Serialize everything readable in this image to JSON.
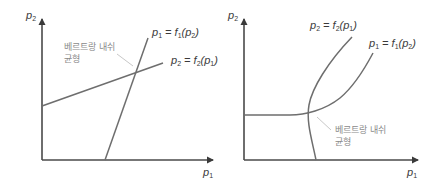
{
  "panels": [
    {
      "id": "left",
      "axes": {
        "y_label": "p",
        "y_sub": "2",
        "x_label": "p",
        "x_sub": "1"
      },
      "curves": [
        {
          "name": "reaction-p1",
          "label_lhs": "p",
          "label_lhs_sub": "1",
          "label_rhs_fn": "f",
          "label_rhs_fn_sub": "1",
          "label_rhs_arg": "p",
          "label_rhs_arg_sub": "2",
          "shape": "line"
        },
        {
          "name": "reaction-p2",
          "label_lhs": "p",
          "label_lhs_sub": "2",
          "label_rhs_fn": "f",
          "label_rhs_fn_sub": "2",
          "label_rhs_arg": "p",
          "label_rhs_arg_sub": "1",
          "shape": "line"
        }
      ],
      "annotation": {
        "text": "베르트랑 내쉬\n균형"
      }
    },
    {
      "id": "right",
      "axes": {
        "y_label": "p",
        "y_sub": "2",
        "x_label": "p",
        "x_sub": "1"
      },
      "curves": [
        {
          "name": "reaction-p2",
          "label_lhs": "p",
          "label_lhs_sub": "2",
          "label_rhs_fn": "f",
          "label_rhs_fn_sub": "2",
          "label_rhs_arg": "p",
          "label_rhs_arg_sub": "1",
          "shape": "curve"
        },
        {
          "name": "reaction-p1",
          "label_lhs": "p",
          "label_lhs_sub": "1",
          "label_rhs_fn": "f",
          "label_rhs_fn_sub": "1",
          "label_rhs_arg": "p",
          "label_rhs_arg_sub": "2",
          "shape": "curve"
        }
      ],
      "annotation": {
        "text": "베르트랑 내쉬\n균형"
      }
    }
  ],
  "colors": {
    "axis": "#4a4a4a",
    "curve": "#6e6e6e",
    "leader": "#c8c8c8",
    "text": "#3a3a3a",
    "note": "#8a8a8a"
  }
}
